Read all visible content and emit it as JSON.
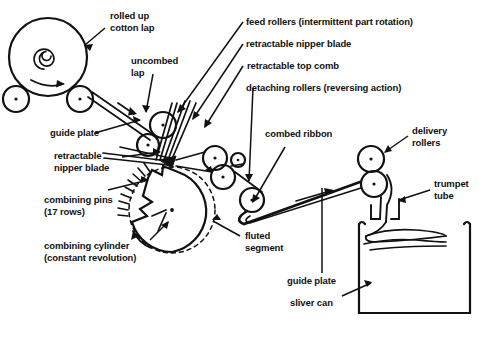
{
  "diagram": {
    "background": "#ffffff",
    "ink": "#111111"
  },
  "labels": {
    "rolled_up_cotton_lap": "rolled up\ncotton lap",
    "uncombed_lap": "uncombed\nlap",
    "feed_rollers": "feed rollers (intermittent part rotation)",
    "retractable_nipper_blade_top": "retractable nipper blade",
    "retractable_top_comb": "retractable top comb",
    "detaching_rollers": "detaching rollers (reversing action)",
    "guide_plate_left": "guide plate",
    "retractable_nipper_blade_left": "retractable\nnipper blade",
    "combing_pins": "combining pins\n(17 rows)",
    "combing_cylinder": "combining cylinder\n(constant revolution)",
    "fluted_segment": "fluted\nsegment",
    "combed_ribbon": "combed ribbon",
    "delivery_rollers": "delivery\nrollers",
    "trumpet_tube": "trumpet\ntube",
    "guide_plate_bottom": "guide plate",
    "sliver_can": "sliver can"
  },
  "parts": {
    "lap_roll": "rolled-up cotton lap cylinder",
    "support_roller_left": "lap support roller left",
    "support_roller_right": "lap support roller right",
    "feed_roller_a": "feed roller upper",
    "feed_roller_b": "feed roller lower",
    "detaching_roller_a": "detaching roller upper",
    "detaching_roller_b": "detaching roller lower",
    "detaching_roller_c": "detaching roller small",
    "detaching_roller_d": "detaching roller outer",
    "combing_cylinder_body": "combing cylinder with pin segment",
    "delivery_roller_top": "delivery roller top",
    "delivery_roller_bottom": "delivery roller bottom",
    "trumpet": "trumpet tube",
    "can": "sliver can",
    "rotation_arrow": "lap rotation direction arrow",
    "web_arrow_1": "lap travel arrow",
    "web_arrow_2": "ribbon travel arrow"
  }
}
